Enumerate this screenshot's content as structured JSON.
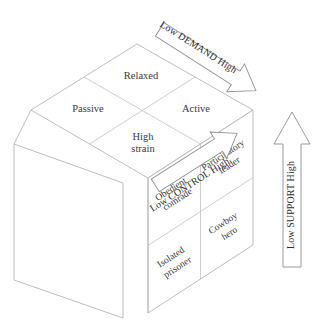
{
  "diagram": {
    "colors": {
      "line": "#b5b5b5",
      "arrow_stroke": "#8f8f8f",
      "text": "#3a3a3a",
      "background": "#ffffff"
    },
    "top_face": {
      "name": "demand-control-quadrants",
      "cells": [
        {
          "id": "relaxed",
          "label": "Relaxed"
        },
        {
          "id": "passive",
          "label": "Passive"
        },
        {
          "id": "active",
          "label": "Active"
        },
        {
          "id": "high-strain",
          "label_line1": "High",
          "label_line2": "strain"
        }
      ]
    },
    "right_face": {
      "name": "support-quadrants",
      "cells": [
        {
          "id": "participatory-leader",
          "label_line1": "Participatory",
          "label_line2": "leader"
        },
        {
          "id": "obedient-comrade",
          "label_line1": "Obedient",
          "label_line2": "comrade"
        },
        {
          "id": "cowboy-hero",
          "label_line1": "Cowboy",
          "label_line2": "hero"
        },
        {
          "id": "isolated-prisoner",
          "label_line1": "Isolated",
          "label_line2": "prisoner"
        }
      ]
    },
    "left_face": {
      "name": "blank-left-face",
      "label": ""
    },
    "axes": [
      {
        "id": "demand",
        "label": "Low  DEMAND High",
        "direction": "down-right"
      },
      {
        "id": "control",
        "label": "Low  CONTROL High",
        "direction": "up-right"
      },
      {
        "id": "support",
        "label": "Low  SUPPORT High",
        "direction": "up"
      }
    ]
  }
}
